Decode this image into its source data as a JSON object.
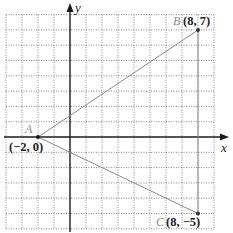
{
  "figure": {
    "type": "coordinate-plane",
    "x_range": [
      -4,
      9
    ],
    "y_range": [
      -6,
      8
    ],
    "grid": true,
    "axes": {
      "x_label": "x",
      "y_label": "y"
    }
  },
  "points": [
    {
      "name": "A",
      "coord_label": "(−2, 0)",
      "x": -2,
      "y": 0
    },
    {
      "name": "B",
      "coord_label": "(8, 7)",
      "x": 8,
      "y": 7
    },
    {
      "name": "C",
      "coord_label": "(8, −5)",
      "x": 8,
      "y": -5
    }
  ],
  "segments": [
    {
      "from": "A",
      "to": "B"
    },
    {
      "from": "A",
      "to": "C"
    },
    {
      "from": "B",
      "to": "C"
    }
  ],
  "colors": {
    "axis": "#1a1a1a",
    "grid": "#666666",
    "segment": "#8a8a8a",
    "point_name": "#8a8a8a"
  }
}
